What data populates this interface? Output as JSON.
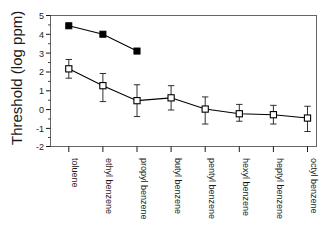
{
  "chart_data": {
    "type": "line",
    "title": "",
    "xlabel": "",
    "ylabel": "Threshold (log ppm)",
    "ylim": [
      -2,
      5
    ],
    "yticks": [
      -2,
      -1,
      0,
      1,
      2,
      3,
      4,
      5
    ],
    "ytick_labels": [
      "-2",
      "-1",
      "0",
      "1",
      "2",
      "3",
      "4",
      "5"
    ],
    "grid": false,
    "legend": "none",
    "categories": [
      "toluene",
      "ethyl benzene",
      "propyl benzene",
      "butyl benzene",
      "pentyl benzene",
      "hexyl benzene",
      "heptyl benzene",
      "octyl benzene"
    ],
    "xtick_rotation": 90,
    "series": [
      {
        "name": "filled-square-series",
        "marker": "filled-square",
        "marker_color": "#000000",
        "line_color": "#000000",
        "has_error_bars": false,
        "values": [
          4.45,
          4.0,
          3.1,
          null,
          null,
          null,
          null,
          null
        ]
      },
      {
        "name": "open-square-series",
        "marker": "open-square",
        "marker_color": "#ffffff",
        "marker_edge_color": "#000000",
        "line_color": "#000000",
        "has_error_bars": true,
        "values": [
          2.15,
          1.25,
          0.45,
          0.6,
          0.0,
          -0.25,
          -0.3,
          -0.48
        ],
        "err_upper": [
          2.65,
          1.9,
          1.3,
          1.25,
          0.65,
          0.25,
          0.2,
          0.15
        ],
        "err_lower": [
          1.65,
          0.4,
          -0.4,
          -0.05,
          -0.8,
          -0.65,
          -0.8,
          -1.2
        ]
      }
    ]
  },
  "axes": {
    "frame_color": "#555555",
    "tick_color": "#1a1a1a"
  }
}
